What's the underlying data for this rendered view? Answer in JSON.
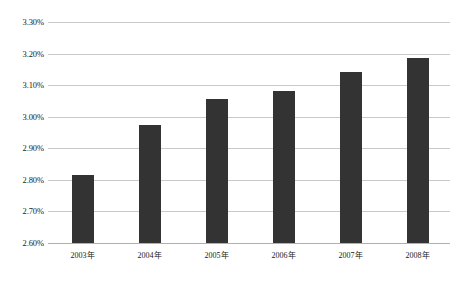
{
  "chart_data": {
    "type": "bar",
    "title": "",
    "subtitle": "",
    "xlabel": "",
    "ylabel": "",
    "categories": [
      "2003年",
      "2004年",
      "2005年",
      "2006年",
      "2007年",
      "2008年"
    ],
    "values": [
      2.815,
      2.975,
      3.055,
      3.082,
      3.142,
      3.185
    ],
    "value_labels": [
      "2.815%",
      "2.975%",
      "3.055%",
      "3.082%",
      "3.142%",
      "3.185%"
    ],
    "ylim": [
      2.6,
      3.3
    ],
    "ytick_values": [
      3.3,
      3.2,
      3.1,
      3.0,
      2.9,
      2.8,
      2.7,
      2.6
    ],
    "ytick_labels": [
      "3.30%",
      "3.20%",
      "3.10%",
      "3.00%",
      "2.90%",
      "2.80%",
      "2.70%",
      "2.60%"
    ],
    "grid": true,
    "grid_axis": "y",
    "legend": false,
    "legend_position": "none",
    "annotations": [],
    "series": [
      {
        "name": "",
        "values": [
          2.815,
          2.975,
          3.055,
          3.082,
          3.142,
          3.185
        ]
      }
    ]
  },
  "colors": {
    "bar": "#333333",
    "gridline": "#c9c9c9",
    "baseline": "#b0b0b0",
    "background": "#ffffff",
    "text": "#1a1a1a"
  }
}
